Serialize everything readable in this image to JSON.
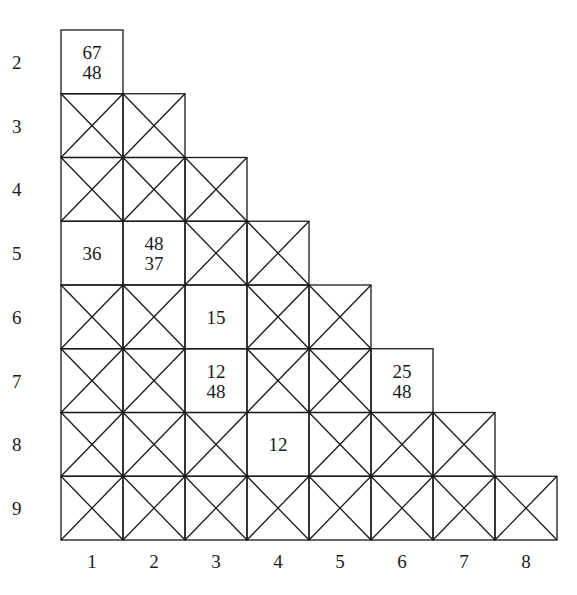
{
  "diagram": {
    "type": "triangular-grid",
    "row_labels": [
      "2",
      "3",
      "4",
      "5",
      "6",
      "7",
      "8",
      "9"
    ],
    "col_labels": [
      "1",
      "2",
      "3",
      "4",
      "5",
      "6",
      "7",
      "8"
    ],
    "line_color": "#1a1a1a",
    "cells": [
      {
        "row": "2",
        "col": "1",
        "crossed": false,
        "values": [
          "67",
          "48"
        ]
      },
      {
        "row": "3",
        "col": "1",
        "crossed": true,
        "values": []
      },
      {
        "row": "3",
        "col": "2",
        "crossed": true,
        "values": []
      },
      {
        "row": "4",
        "col": "1",
        "crossed": true,
        "values": []
      },
      {
        "row": "4",
        "col": "2",
        "crossed": true,
        "values": []
      },
      {
        "row": "4",
        "col": "3",
        "crossed": true,
        "values": []
      },
      {
        "row": "5",
        "col": "1",
        "crossed": false,
        "values": [
          "36"
        ]
      },
      {
        "row": "5",
        "col": "2",
        "crossed": false,
        "values": [
          "48",
          "37"
        ]
      },
      {
        "row": "5",
        "col": "3",
        "crossed": true,
        "values": []
      },
      {
        "row": "5",
        "col": "4",
        "crossed": true,
        "values": []
      },
      {
        "row": "6",
        "col": "1",
        "crossed": true,
        "values": []
      },
      {
        "row": "6",
        "col": "2",
        "crossed": true,
        "values": []
      },
      {
        "row": "6",
        "col": "3",
        "crossed": false,
        "values": [
          "15"
        ]
      },
      {
        "row": "6",
        "col": "4",
        "crossed": true,
        "values": []
      },
      {
        "row": "6",
        "col": "5",
        "crossed": true,
        "values": []
      },
      {
        "row": "7",
        "col": "1",
        "crossed": true,
        "values": []
      },
      {
        "row": "7",
        "col": "2",
        "crossed": true,
        "values": []
      },
      {
        "row": "7",
        "col": "3",
        "crossed": false,
        "values": [
          "12",
          "48"
        ]
      },
      {
        "row": "7",
        "col": "4",
        "crossed": true,
        "values": []
      },
      {
        "row": "7",
        "col": "5",
        "crossed": true,
        "values": []
      },
      {
        "row": "7",
        "col": "6",
        "crossed": false,
        "values": [
          "25",
          "48"
        ]
      },
      {
        "row": "8",
        "col": "1",
        "crossed": true,
        "values": []
      },
      {
        "row": "8",
        "col": "2",
        "crossed": true,
        "values": []
      },
      {
        "row": "8",
        "col": "3",
        "crossed": true,
        "values": []
      },
      {
        "row": "8",
        "col": "4",
        "crossed": false,
        "values": [
          "12"
        ]
      },
      {
        "row": "8",
        "col": "5",
        "crossed": true,
        "values": []
      },
      {
        "row": "8",
        "col": "6",
        "crossed": true,
        "values": []
      },
      {
        "row": "8",
        "col": "7",
        "crossed": true,
        "values": []
      },
      {
        "row": "9",
        "col": "1",
        "crossed": true,
        "values": []
      },
      {
        "row": "9",
        "col": "2",
        "crossed": true,
        "values": []
      },
      {
        "row": "9",
        "col": "3",
        "crossed": true,
        "values": []
      },
      {
        "row": "9",
        "col": "4",
        "crossed": true,
        "values": []
      },
      {
        "row": "9",
        "col": "5",
        "crossed": true,
        "values": []
      },
      {
        "row": "9",
        "col": "6",
        "crossed": true,
        "values": []
      },
      {
        "row": "9",
        "col": "7",
        "crossed": true,
        "values": []
      },
      {
        "row": "9",
        "col": "8",
        "crossed": true,
        "values": []
      }
    ]
  }
}
